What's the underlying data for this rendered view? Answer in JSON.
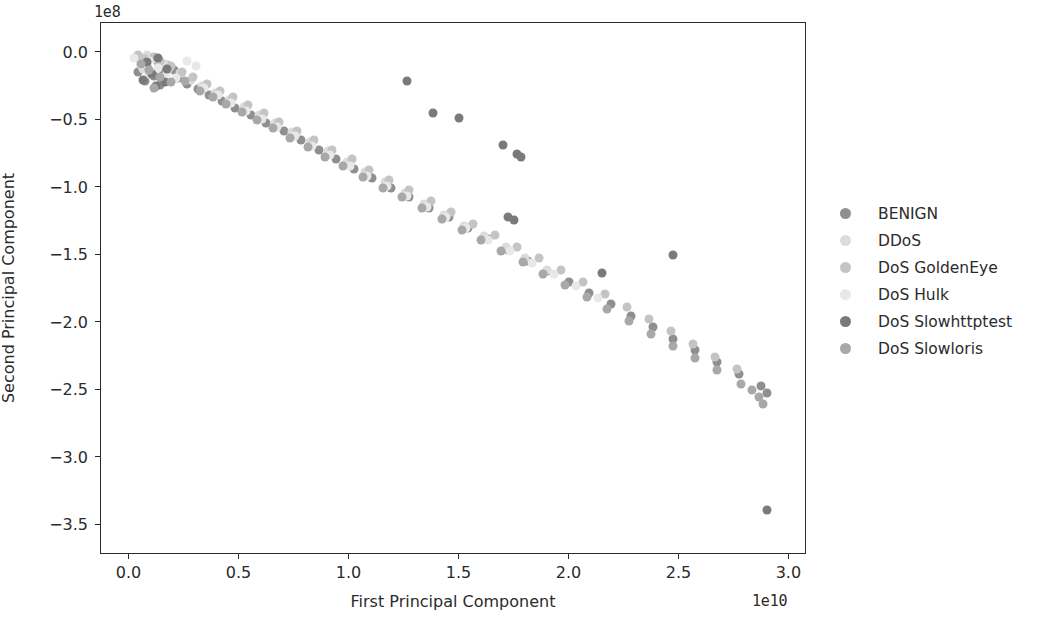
{
  "chart_data": {
    "type": "scatter",
    "title": "",
    "xlabel": "First Principal Component",
    "ylabel": "Second Principal Component",
    "x_offset_text": "1e10",
    "y_offset_text": "1e8",
    "xlim": [
      -0.13,
      3.08
    ],
    "ylim": [
      -3.72,
      0.22
    ],
    "xticks": [
      0.0,
      0.5,
      1.0,
      1.5,
      2.0,
      2.5,
      3.0
    ],
    "xticklabels": [
      "0.0",
      "0.5",
      "1.0",
      "1.5",
      "2.0",
      "2.5",
      "3.0"
    ],
    "yticks": [
      0.0,
      -0.5,
      -1.0,
      -1.5,
      -2.0,
      -2.5,
      -3.0,
      -3.5
    ],
    "yticklabels": [
      "0.0",
      "−0.5",
      "−1.0",
      "−1.5",
      "−2.0",
      "−2.5",
      "−3.0",
      "−3.5"
    ],
    "grid": false,
    "legend_position": "right",
    "marker_size": 9,
    "series": [
      {
        "name": "BENIGN",
        "color": "#8f8f8f",
        "points": [
          [
            0.06,
            -0.05
          ],
          [
            0.1,
            -0.04
          ],
          [
            0.13,
            -0.07
          ],
          [
            0.08,
            -0.1
          ],
          [
            0.15,
            -0.12
          ],
          [
            0.04,
            -0.14
          ],
          [
            0.11,
            -0.17
          ],
          [
            0.17,
            -0.09
          ],
          [
            0.2,
            -0.13
          ],
          [
            0.07,
            -0.21
          ],
          [
            0.14,
            -0.24
          ],
          [
            0.22,
            -0.19
          ],
          [
            0.26,
            -0.23
          ],
          [
            0.31,
            -0.27
          ],
          [
            0.36,
            -0.31
          ],
          [
            0.42,
            -0.36
          ],
          [
            0.48,
            -0.41
          ],
          [
            0.55,
            -0.46
          ],
          [
            0.62,
            -0.52
          ],
          [
            0.7,
            -0.58
          ],
          [
            0.78,
            -0.65
          ],
          [
            0.86,
            -0.72
          ],
          [
            0.94,
            -0.79
          ],
          [
            1.02,
            -0.86
          ],
          [
            1.1,
            -0.93
          ],
          [
            1.19,
            -1.0
          ],
          [
            1.27,
            -1.07
          ],
          [
            1.36,
            -1.15
          ],
          [
            1.45,
            -1.22
          ],
          [
            1.54,
            -1.3
          ],
          [
            1.63,
            -1.38
          ],
          [
            1.72,
            -1.46
          ],
          [
            1.81,
            -1.54
          ],
          [
            1.9,
            -1.62
          ],
          [
            2.0,
            -1.7
          ],
          [
            2.09,
            -1.78
          ],
          [
            2.19,
            -1.86
          ],
          [
            2.28,
            -1.95
          ],
          [
            2.38,
            -2.03
          ],
          [
            2.47,
            -2.12
          ],
          [
            2.57,
            -2.2
          ],
          [
            2.67,
            -2.29
          ],
          [
            2.77,
            -2.38
          ],
          [
            2.87,
            -2.47
          ],
          [
            2.9,
            -2.52
          ]
        ]
      },
      {
        "name": "DDoS",
        "color": "#dcdcdc",
        "points": [
          [
            0.03,
            -0.03
          ],
          [
            0.05,
            -0.06
          ],
          [
            0.08,
            -0.02
          ],
          [
            0.12,
            -0.05
          ],
          [
            0.16,
            -0.08
          ],
          [
            0.06,
            -0.12
          ],
          [
            0.09,
            -0.16
          ],
          [
            0.18,
            -0.11
          ],
          [
            0.23,
            -0.15
          ],
          [
            0.28,
            -0.2
          ],
          [
            0.33,
            -0.25
          ],
          [
            0.39,
            -0.3
          ],
          [
            0.45,
            -0.35
          ],
          [
            0.52,
            -0.4
          ],
          [
            0.59,
            -0.46
          ],
          [
            0.66,
            -0.52
          ],
          [
            0.74,
            -0.59
          ],
          [
            0.82,
            -0.66
          ],
          [
            0.9,
            -0.73
          ],
          [
            0.99,
            -0.81
          ],
          [
            1.07,
            -0.88
          ],
          [
            1.16,
            -0.96
          ],
          [
            1.25,
            -1.04
          ],
          [
            1.34,
            -1.12
          ],
          [
            1.43,
            -1.2
          ],
          [
            1.52,
            -1.28
          ],
          [
            1.61,
            -1.36
          ],
          [
            1.71,
            -1.44
          ],
          [
            1.8,
            -1.52
          ],
          [
            1.9,
            -1.61
          ]
        ]
      },
      {
        "name": "DoS GoldenEye",
        "color": "#c4c4c4",
        "points": [
          [
            0.04,
            -0.02
          ],
          [
            0.07,
            -0.05
          ],
          [
            0.11,
            -0.03
          ],
          [
            0.14,
            -0.06
          ],
          [
            0.19,
            -0.1
          ],
          [
            0.24,
            -0.14
          ],
          [
            0.29,
            -0.18
          ],
          [
            0.35,
            -0.23
          ],
          [
            0.41,
            -0.28
          ],
          [
            0.47,
            -0.33
          ],
          [
            0.54,
            -0.39
          ],
          [
            0.61,
            -0.45
          ],
          [
            0.68,
            -0.51
          ],
          [
            0.76,
            -0.58
          ],
          [
            0.84,
            -0.65
          ],
          [
            0.92,
            -0.72
          ],
          [
            1.01,
            -0.79
          ],
          [
            1.09,
            -0.87
          ],
          [
            1.18,
            -0.94
          ],
          [
            1.27,
            -1.02
          ],
          [
            1.37,
            -1.1
          ],
          [
            1.46,
            -1.18
          ],
          [
            1.56,
            -1.27
          ],
          [
            1.66,
            -1.35
          ],
          [
            1.76,
            -1.44
          ],
          [
            1.86,
            -1.52
          ],
          [
            1.96,
            -1.61
          ],
          [
            2.06,
            -1.7
          ],
          [
            2.16,
            -1.79
          ],
          [
            2.26,
            -1.88
          ],
          [
            2.36,
            -1.97
          ],
          [
            2.46,
            -2.06
          ],
          [
            2.56,
            -2.16
          ],
          [
            2.66,
            -2.25
          ],
          [
            2.76,
            -2.34
          ]
        ]
      },
      {
        "name": "DoS Hulk",
        "color": "#e8e8e8",
        "points": [
          [
            0.02,
            -0.04
          ],
          [
            0.05,
            -0.09
          ],
          [
            0.09,
            -0.06
          ],
          [
            0.13,
            -0.11
          ],
          [
            0.17,
            -0.15
          ],
          [
            0.21,
            -0.19
          ],
          [
            0.26,
            -0.06
          ],
          [
            0.3,
            -0.1
          ],
          [
            0.34,
            -0.26
          ],
          [
            0.4,
            -0.31
          ],
          [
            0.46,
            -0.37
          ],
          [
            0.53,
            -0.43
          ],
          [
            0.6,
            -0.49
          ],
          [
            0.67,
            -0.55
          ],
          [
            0.75,
            -0.62
          ],
          [
            0.83,
            -0.69
          ],
          [
            0.91,
            -0.76
          ],
          [
            1.0,
            -0.84
          ],
          [
            1.08,
            -0.91
          ],
          [
            1.17,
            -0.99
          ],
          [
            1.26,
            -1.06
          ],
          [
            1.35,
            -1.14
          ],
          [
            1.44,
            -1.22
          ],
          [
            1.53,
            -1.3
          ],
          [
            1.63,
            -1.39
          ],
          [
            1.73,
            -1.47
          ],
          [
            1.83,
            -1.56
          ],
          [
            1.93,
            -1.64
          ],
          [
            2.03,
            -1.73
          ],
          [
            2.13,
            -1.82
          ]
        ]
      },
      {
        "name": "DoS Slowhttptest",
        "color": "#7a7a7a",
        "points": [
          [
            0.08,
            -0.07
          ],
          [
            0.13,
            -0.04
          ],
          [
            0.17,
            -0.12
          ],
          [
            0.1,
            -0.16
          ],
          [
            0.06,
            -0.2
          ],
          [
            0.16,
            -0.22
          ],
          [
            0.12,
            -0.25
          ],
          [
            1.26,
            -0.21
          ],
          [
            1.38,
            -0.45
          ],
          [
            1.5,
            -0.48
          ],
          [
            1.7,
            -0.68
          ],
          [
            1.76,
            -0.75
          ],
          [
            1.78,
            -0.77
          ],
          [
            1.72,
            -1.22
          ],
          [
            1.75,
            -1.24
          ],
          [
            2.15,
            -1.63
          ],
          [
            2.47,
            -1.5
          ],
          [
            2.9,
            -3.39
          ]
        ]
      },
      {
        "name": "DoS Slowloris",
        "color": "#a8a8a8",
        "points": [
          [
            0.05,
            -0.08
          ],
          [
            0.09,
            -0.13
          ],
          [
            0.14,
            -0.18
          ],
          [
            0.19,
            -0.22
          ],
          [
            0.11,
            -0.26
          ],
          [
            0.25,
            -0.21
          ],
          [
            0.32,
            -0.28
          ],
          [
            0.38,
            -0.33
          ],
          [
            0.44,
            -0.38
          ],
          [
            0.51,
            -0.44
          ],
          [
            0.58,
            -0.5
          ],
          [
            0.65,
            -0.56
          ],
          [
            0.73,
            -0.63
          ],
          [
            0.81,
            -0.7
          ],
          [
            0.89,
            -0.77
          ],
          [
            0.97,
            -0.84
          ],
          [
            1.06,
            -0.92
          ],
          [
            1.15,
            -1.0
          ],
          [
            1.24,
            -1.07
          ],
          [
            1.33,
            -1.15
          ],
          [
            1.42,
            -1.23
          ],
          [
            1.51,
            -1.31
          ],
          [
            1.6,
            -1.39
          ],
          [
            1.69,
            -1.47
          ],
          [
            1.79,
            -1.55
          ],
          [
            1.88,
            -1.64
          ],
          [
            1.98,
            -1.72
          ],
          [
            2.08,
            -1.81
          ],
          [
            2.17,
            -1.9
          ],
          [
            2.27,
            -1.99
          ],
          [
            2.37,
            -2.08
          ],
          [
            2.47,
            -2.17
          ],
          [
            2.57,
            -2.26
          ],
          [
            2.67,
            -2.35
          ],
          [
            2.78,
            -2.45
          ],
          [
            2.83,
            -2.5
          ],
          [
            2.86,
            -2.55
          ],
          [
            2.88,
            -2.6
          ]
        ]
      }
    ]
  },
  "legend": {
    "items": [
      {
        "label": "BENIGN"
      },
      {
        "label": "DDoS"
      },
      {
        "label": "DoS GoldenEye"
      },
      {
        "label": "DoS Hulk"
      },
      {
        "label": "DoS Slowhttptest"
      },
      {
        "label": "DoS Slowloris"
      }
    ]
  }
}
